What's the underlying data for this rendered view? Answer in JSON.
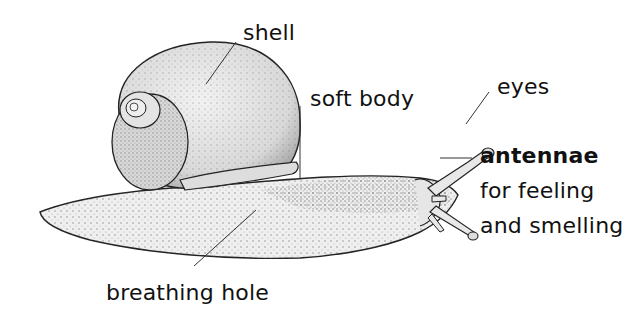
{
  "diagram": {
    "labels": {
      "shell": "shell",
      "soft_body": "soft body",
      "eyes": "eyes",
      "antennae": "antennae",
      "antennae_desc_1": "for feeling",
      "antennae_desc_2": "and smelling",
      "breathing_hole": "breathing hole"
    },
    "colors": {
      "ink": "#111111",
      "background": "#ffffff",
      "stipple": "#555555"
    }
  }
}
